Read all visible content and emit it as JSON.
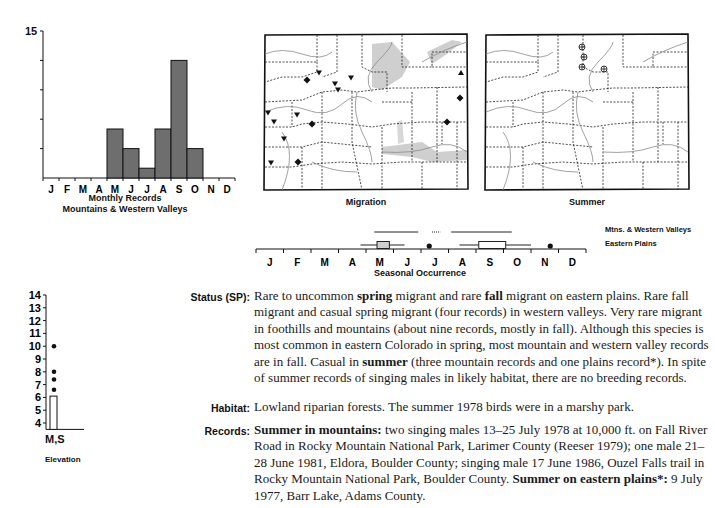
{
  "monthly_chart": {
    "y_top_label": "15",
    "caption_line1": "Monthly Records",
    "caption_line2": "Mountains & Western Valleys"
  },
  "maps": {
    "migration_caption": "Migration",
    "summer_caption": "Summer"
  },
  "seasonal": {
    "caption": "Seasonal Occurrence",
    "legend_mtns": "Mtns. & Western Valleys",
    "legend_plains": "Eastern Plains",
    "months": [
      "J",
      "F",
      "M",
      "A",
      "M",
      "J",
      "J",
      "A",
      "S",
      "O",
      "N",
      "D"
    ]
  },
  "elevation": {
    "x_label": "M,S",
    "caption": "Elevation",
    "ticks": [
      "14",
      "13",
      "12",
      "11",
      "10",
      "9",
      "8",
      "7",
      "6",
      "5",
      "4"
    ]
  },
  "text": {
    "status_label": "Status (SP):",
    "status": {
      "p1": "Rare to uncommon ",
      "b1": "spring",
      "p2": " migrant and rare ",
      "b2": "fall",
      "p3": " migrant on eastern plains. Rare fall migrant and casual spring migrant (four records) in western valleys. Very rare migrant in foothills and mountains (about nine records, mostly in fall). Although this species is most common in eastern Colorado in spring, most mountain and western valley records are in fall. Casual in ",
      "b3": "summer",
      "p4": " (three mountain records and one plains record*). In spite of summer records of singing males in likely habitat, there are no breeding records."
    },
    "habitat_label": "Habitat:",
    "habitat": "Lowland riparian forests. The summer 1978 birds were in a marshy park.",
    "records_label": "Records:",
    "records": {
      "b1": "Summer in mountains:",
      "p1": " two singing males 13–25 July 1978 at 10,000 ft. on Fall River Road in Rocky Mountain National Park, Larimer County (Reeser 1979); one male 21–28 June 1981, Eldora, Boulder County; singing male 17 June 1986, Ouzel Falls trail in Rocky Mountain National Park, Boulder County. ",
      "b2": "Summer on eastern plains*:",
      "p2": " 9 July 1977, Barr Lake, Adams County."
    }
  },
  "chart_data": [
    {
      "type": "bar",
      "title": "Monthly Records — Mountains & Western Valleys",
      "categories": [
        "J",
        "F",
        "M",
        "A",
        "M",
        "J",
        "J",
        "A",
        "S",
        "O",
        "N",
        "D"
      ],
      "values": [
        0,
        0,
        0,
        0,
        5,
        3,
        1,
        5,
        12,
        3,
        0,
        0
      ],
      "ylim": [
        0,
        15
      ],
      "yticks": [
        0,
        3,
        6,
        9,
        12,
        15
      ],
      "ytick_labels_shown": [
        "15"
      ],
      "grid": false,
      "bar_color": "#6e6e6e"
    },
    {
      "type": "box",
      "title": "Seasonal Occurrence",
      "x_categories": [
        "J",
        "F",
        "M",
        "A",
        "M",
        "J",
        "J",
        "A",
        "S",
        "O",
        "N",
        "D"
      ],
      "series": [
        {
          "name": "Mtns. & Western Valleys",
          "ranges": [
            [
              "early May",
              "late Jun"
            ],
            [
              "early Aug",
              "early Oct"
            ]
          ],
          "dotted_gap": [
            "mid Jul",
            "late Jul"
          ]
        },
        {
          "name": "Eastern Plains",
          "spring": {
            "whisker": [
              "mid Apr",
              "mid Jun"
            ],
            "box": [
              "early May",
              "mid May"
            ]
          },
          "fall": {
            "whisker": [
              "early Aug",
              "mid Oct"
            ],
            "box": [
              "mid Aug",
              "early Oct"
            ]
          },
          "outliers": [
            "early Jul",
            "mid Nov"
          ]
        }
      ]
    },
    {
      "type": "scatter",
      "title": "Elevation",
      "xlabel": "M,S",
      "ylabel": "Elevation (thousand ft)",
      "ylim": [
        3.5,
        14
      ],
      "yticks": [
        4,
        5,
        6,
        7,
        8,
        9,
        10,
        11,
        12,
        13,
        14
      ],
      "bar_top": 6.1,
      "points": [
        10.0,
        8.0,
        7.4,
        6.6
      ]
    }
  ]
}
